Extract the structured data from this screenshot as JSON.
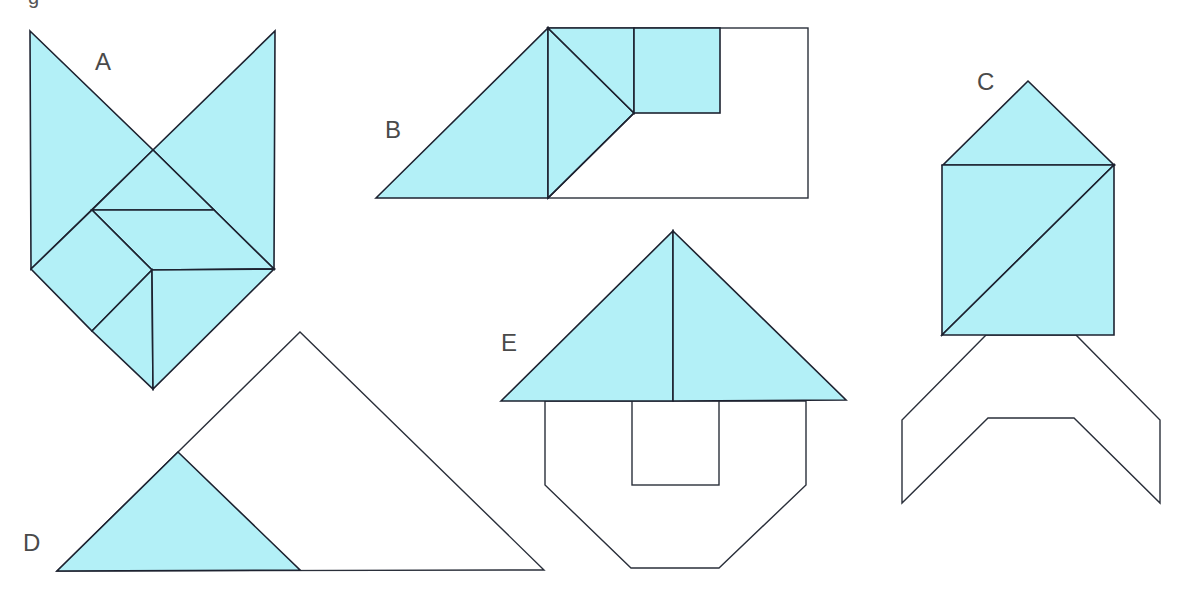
{
  "figure": {
    "fill_color": "#b3f0f7",
    "stroke_color": "#1d2230",
    "clipped_top_text": "g",
    "labels": {
      "A": "A",
      "B": "B",
      "C": "C",
      "D": "D",
      "E": "E"
    },
    "figures": [
      {
        "id": "A",
        "description": "Fox-head shape fully composed of 7 shaded tangram pieces"
      },
      {
        "id": "B",
        "description": "Rectangle outline with 4 shaded pieces (2 triangles, small triangle, square) and empty region"
      },
      {
        "id": "C",
        "description": "Rocket/house shape: shaded triangle roof and square split by diagonal, with unshaded chevron outline below"
      },
      {
        "id": "D",
        "description": "Large triangle outline with one shaded triangle in lower-left corner"
      },
      {
        "id": "E",
        "description": "House shape: shaded roof split into two triangles, unshaded octagonal body with square notch"
      }
    ]
  }
}
